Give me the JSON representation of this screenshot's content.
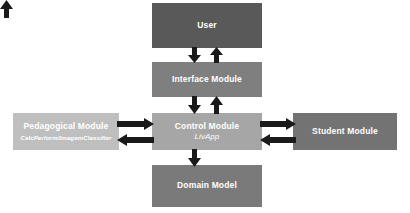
{
  "diagram": {
    "background_color": "#ffffff",
    "arrow_color": "#1a1a1a",
    "nodes": [
      {
        "id": "user",
        "label": "User",
        "sublabel": "",
        "fill": "#595959",
        "text_color": "#ffffff",
        "x": 152,
        "y": 3,
        "w": 110,
        "h": 45
      },
      {
        "id": "interface-module",
        "label": "Interface Module",
        "sublabel": "",
        "fill": "#7f7f7f",
        "text_color": "#ffffff",
        "x": 152,
        "y": 62,
        "w": 110,
        "h": 35
      },
      {
        "id": "pedagogical-module",
        "label": "Pedagogical Module",
        "sublabel": "CalcPerform/ImagemClassifier",
        "fill": "#bfbfbf",
        "text_color": "#ffffff",
        "x": 13,
        "y": 113,
        "w": 106,
        "h": 37
      },
      {
        "id": "control-module",
        "label": "Control Module",
        "sublabel": "LivApp",
        "fill": "#a6a6a6",
        "text_color": "#ffffff",
        "x": 152,
        "y": 113,
        "w": 110,
        "h": 37
      },
      {
        "id": "student-module",
        "label": "Student Module",
        "sublabel": "",
        "fill": "#737373",
        "text_color": "#ffffff",
        "x": 293,
        "y": 113,
        "w": 104,
        "h": 37
      },
      {
        "id": "domain-model",
        "label": "Domain Model",
        "sublabel": "",
        "fill": "#7a7a7a",
        "text_color": "#ffffff",
        "x": 152,
        "y": 165,
        "w": 110,
        "h": 42
      }
    ],
    "connections": [
      {
        "id": "user-to-interface",
        "from": "user",
        "to": "interface-module",
        "direction": "down"
      },
      {
        "id": "interface-to-user",
        "from": "interface-module",
        "to": "user",
        "direction": "up"
      },
      {
        "id": "interface-to-control",
        "from": "interface-module",
        "to": "control-module",
        "direction": "down"
      },
      {
        "id": "control-to-interface",
        "from": "control-module",
        "to": "interface-module",
        "direction": "up"
      },
      {
        "id": "pedagogical-to-control",
        "from": "pedagogical-module",
        "to": "control-module",
        "direction": "right"
      },
      {
        "id": "control-to-pedagogical",
        "from": "control-module",
        "to": "pedagogical-module",
        "direction": "left"
      },
      {
        "id": "control-to-student",
        "from": "control-module",
        "to": "student-module",
        "direction": "right"
      },
      {
        "id": "student-to-control",
        "from": "student-module",
        "to": "control-module",
        "direction": "left"
      },
      {
        "id": "control-to-domain",
        "from": "control-module",
        "to": "domain-model",
        "direction": "down"
      },
      {
        "id": "domain-to-control",
        "from": "domain-model",
        "to": "control-module",
        "direction": "up"
      }
    ]
  }
}
